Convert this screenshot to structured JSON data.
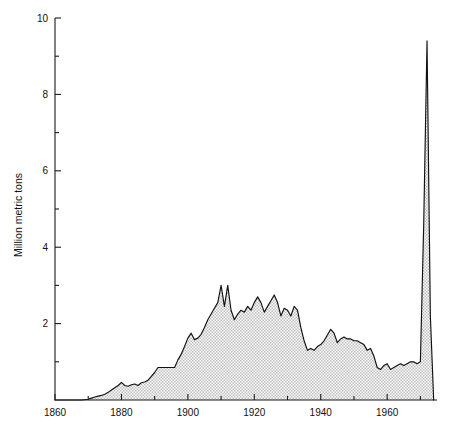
{
  "chart_data": {
    "type": "area",
    "title": "",
    "xlabel": "",
    "ylabel": "Million metric tons",
    "xlim": [
      1860,
      1975
    ],
    "ylim": [
      0,
      10
    ],
    "grid": false,
    "legend": "none",
    "x_ticks_major": [
      1860,
      1880,
      1900,
      1920,
      1940,
      1960
    ],
    "x_ticks_minor": [
      1870,
      1890,
      1910,
      1930,
      1950,
      1970
    ],
    "y_ticks_major": [
      0,
      2,
      4,
      6,
      8,
      10
    ],
    "y_ticks_minor": [
      1,
      3,
      5,
      7,
      9
    ],
    "x_tick_labels": [
      "1860",
      "1880",
      "1900",
      "1920",
      "1940",
      "1960"
    ],
    "y_tick_labels": [
      "2",
      "4",
      "6",
      "8",
      "10"
    ],
    "fill_color": "#d9d9d9",
    "line_color": "#111111",
    "series": [
      {
        "name": "Million metric tons",
        "x": [
          1860,
          1865,
          1868,
          1870,
          1871,
          1872,
          1873,
          1874,
          1875,
          1876,
          1877,
          1878,
          1879,
          1880,
          1881,
          1882,
          1883,
          1884,
          1885,
          1886,
          1887,
          1888,
          1889,
          1890,
          1891,
          1892,
          1893,
          1894,
          1895,
          1896,
          1897,
          1898,
          1899,
          1900,
          1901,
          1902,
          1903,
          1904,
          1905,
          1906,
          1907,
          1908,
          1909,
          1910,
          1911,
          1912,
          1913,
          1914,
          1915,
          1916,
          1917,
          1918,
          1919,
          1920,
          1921,
          1922,
          1923,
          1924,
          1925,
          1926,
          1927,
          1928,
          1929,
          1930,
          1931,
          1932,
          1933,
          1934,
          1935,
          1936,
          1937,
          1938,
          1939,
          1940,
          1941,
          1942,
          1943,
          1944,
          1945,
          1946,
          1947,
          1948,
          1949,
          1950,
          1951,
          1952,
          1953,
          1954,
          1955,
          1956,
          1957,
          1958,
          1959,
          1960,
          1961,
          1962,
          1963,
          1964,
          1965,
          1966,
          1967,
          1968,
          1969,
          1970,
          1971,
          1972,
          1973,
          1974
        ],
        "values": [
          0.0,
          0.0,
          0.0,
          0.02,
          0.05,
          0.08,
          0.1,
          0.12,
          0.15,
          0.2,
          0.26,
          0.32,
          0.38,
          0.46,
          0.38,
          0.36,
          0.4,
          0.42,
          0.38,
          0.45,
          0.47,
          0.52,
          0.62,
          0.72,
          0.85,
          0.85,
          0.85,
          0.85,
          0.85,
          0.85,
          1.05,
          1.2,
          1.4,
          1.62,
          1.75,
          1.58,
          1.62,
          1.72,
          1.9,
          2.1,
          2.25,
          2.4,
          2.55,
          3.0,
          2.45,
          3.0,
          2.35,
          2.1,
          2.25,
          2.35,
          2.3,
          2.45,
          2.35,
          2.55,
          2.7,
          2.55,
          2.3,
          2.45,
          2.6,
          2.75,
          2.55,
          2.2,
          2.4,
          2.35,
          2.2,
          2.45,
          2.35,
          1.9,
          1.55,
          1.3,
          1.35,
          1.3,
          1.4,
          1.45,
          1.55,
          1.7,
          1.85,
          1.75,
          1.5,
          1.6,
          1.65,
          1.6,
          1.6,
          1.55,
          1.55,
          1.5,
          1.45,
          1.3,
          1.35,
          1.15,
          0.85,
          0.8,
          0.9,
          0.95,
          0.8,
          0.85,
          0.9,
          0.95,
          0.9,
          0.95,
          1.0,
          1.0,
          0.95,
          1.0,
          4.6,
          9.4,
          2.2,
          0.0
        ]
      }
    ]
  },
  "axis": {
    "ylabel": "Million metric tons"
  }
}
